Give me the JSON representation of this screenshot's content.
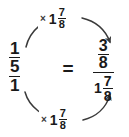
{
  "diagram": {
    "type": "equivalent-fraction-scaling",
    "background_color": "#ffffff",
    "stroke_color": "#3a3a3a",
    "text_color": "#1a1a1a",
    "left_expression": {
      "label": "complex-fraction",
      "numerator": {
        "whole": "",
        "num": "1",
        "den": "5"
      },
      "denominator": "1"
    },
    "relation": "=",
    "right_expression": {
      "label": "complex-fraction",
      "numerator": {
        "whole": "",
        "num": "3",
        "den": "8"
      },
      "denominator": {
        "whole": "1",
        "num": "7",
        "den": "8"
      }
    },
    "top_arc": {
      "operator": "×",
      "operand": {
        "whole": "1",
        "num": "7",
        "den": "8"
      },
      "direction": "left-to-right"
    },
    "bottom_arc": {
      "operator": "×",
      "operand": {
        "whole": "1",
        "num": "7",
        "den": "8"
      },
      "direction": "left-to-right"
    }
  }
}
